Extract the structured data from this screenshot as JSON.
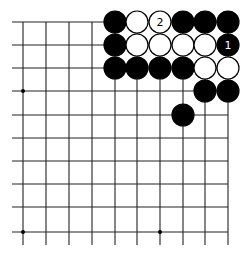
{
  "diagram": {
    "type": "go-board-corner",
    "corner": "top-right",
    "grid": {
      "columns": 10,
      "rows": 10,
      "x_lines": [
        23,
        46,
        69,
        92,
        115,
        137,
        160,
        183,
        205,
        228
      ],
      "y_lines": [
        22,
        45,
        68,
        91,
        115,
        138,
        161,
        184,
        207,
        232
      ],
      "line_color": "#222222"
    },
    "hoshi": [
      [
        0,
        3
      ],
      [
        0,
        9
      ],
      [
        6,
        9
      ]
    ],
    "stones": [
      {
        "col": 4,
        "row": 0,
        "color": "black"
      },
      {
        "col": 5,
        "row": 0,
        "color": "white"
      },
      {
        "col": 6,
        "row": 0,
        "color": "white",
        "label": "2"
      },
      {
        "col": 7,
        "row": 0,
        "color": "black"
      },
      {
        "col": 8,
        "row": 0,
        "color": "black"
      },
      {
        "col": 9,
        "row": 0,
        "color": "black"
      },
      {
        "col": 4,
        "row": 1,
        "color": "black"
      },
      {
        "col": 5,
        "row": 1,
        "color": "white"
      },
      {
        "col": 6,
        "row": 1,
        "color": "white"
      },
      {
        "col": 7,
        "row": 1,
        "color": "white"
      },
      {
        "col": 8,
        "row": 1,
        "color": "white"
      },
      {
        "col": 9,
        "row": 1,
        "color": "black",
        "label": "1"
      },
      {
        "col": 4,
        "row": 2,
        "color": "black"
      },
      {
        "col": 5,
        "row": 2,
        "color": "black"
      },
      {
        "col": 6,
        "row": 2,
        "color": "black"
      },
      {
        "col": 7,
        "row": 2,
        "color": "black"
      },
      {
        "col": 8,
        "row": 2,
        "color": "white"
      },
      {
        "col": 9,
        "row": 2,
        "color": "white"
      },
      {
        "col": 8,
        "row": 3,
        "color": "black"
      },
      {
        "col": 9,
        "row": 3,
        "color": "black"
      },
      {
        "col": 7,
        "row": 4,
        "color": "black"
      }
    ]
  }
}
